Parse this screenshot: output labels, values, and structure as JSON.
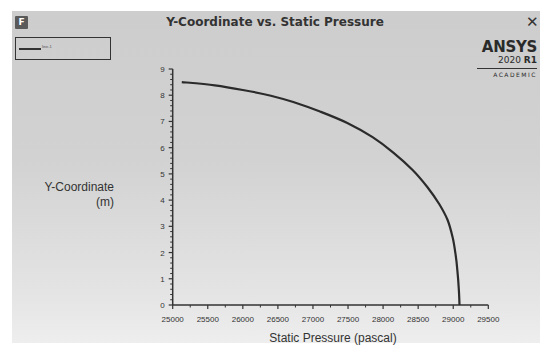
{
  "window": {
    "badge": "F",
    "title": "Y-Coordinate vs. Static Pressure",
    "close_icon": "close-icon"
  },
  "legend": {
    "entries": [
      {
        "label": "line-1",
        "color": "#2b2b2b"
      }
    ]
  },
  "logo": {
    "brand": "ANSYS",
    "version_year": "2020",
    "version_release": "R1",
    "edition": "ACADEMIC"
  },
  "axes": {
    "ylabel_line1": "Y-Coordinate",
    "ylabel_line2": "(m)",
    "xlabel": "Static Pressure (pascal)"
  },
  "colors": {
    "background": "#d0d0d0",
    "curve": "#2b2b2b",
    "axis": "#333333"
  },
  "chart_data": {
    "type": "line",
    "title": "Y-Coordinate vs. Static Pressure",
    "xlabel": "Static Pressure (pascal)",
    "ylabel": "Y-Coordinate (m)",
    "xlim": [
      25000,
      29500
    ],
    "ylim": [
      0,
      9
    ],
    "xticks": [
      25000,
      25500,
      26000,
      26500,
      27000,
      27500,
      28000,
      28500,
      29000,
      29500
    ],
    "yticks": [
      0,
      1,
      2,
      3,
      4,
      5,
      6,
      7,
      8,
      9
    ],
    "grid": false,
    "legend_position": "top-left",
    "series": [
      {
        "name": "line-1",
        "x": [
          25130,
          25600,
          26000,
          26400,
          26720,
          27100,
          27490,
          27850,
          28150,
          28420,
          28630,
          28800,
          28920,
          28990,
          29030,
          29060,
          29080,
          29090
        ],
        "y": [
          8.5,
          8.38,
          8.2,
          7.98,
          7.74,
          7.38,
          6.94,
          6.4,
          5.8,
          5.15,
          4.5,
          3.85,
          3.24,
          2.6,
          2.0,
          1.3,
          0.6,
          0.0
        ]
      }
    ]
  }
}
